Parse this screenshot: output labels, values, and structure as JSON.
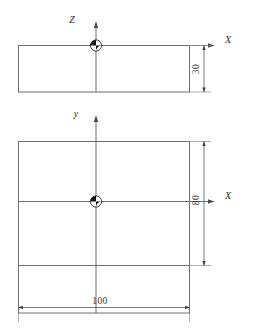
{
  "drawing": {
    "title": "Two-view orthographic dimension drawing with center of gravity marks",
    "background_color": "#ffffff",
    "line_color": "#6e6e6e",
    "text_color": "#2b2b2b",
    "marker_color": "#111111"
  },
  "views": {
    "front_view": {
      "name": "front-elevation",
      "axes": [
        {
          "id": "z-axis",
          "label": "Z",
          "direction": "up"
        },
        {
          "id": "x-axis-top",
          "label": "X",
          "direction": "right"
        }
      ],
      "origin_marker": "center-of-gravity-symbol",
      "dimensions": [
        {
          "id": "height-30",
          "value": "30",
          "orientation": "vertical",
          "side": "right"
        }
      ]
    },
    "top_view": {
      "name": "plan-view",
      "axes": [
        {
          "id": "y-axis",
          "label": "y",
          "direction": "up"
        },
        {
          "id": "x-axis-bottom",
          "label": "X",
          "direction": "right"
        }
      ],
      "origin_marker": "center-of-gravity-symbol",
      "dimensions": [
        {
          "id": "depth-80",
          "value": "80",
          "orientation": "vertical",
          "side": "right"
        },
        {
          "id": "width-100",
          "value": "100",
          "orientation": "horizontal",
          "side": "bottom"
        }
      ]
    }
  },
  "labels": {
    "axis_z": "Z",
    "axis_x_top": "X",
    "axis_y": "y",
    "axis_x_bottom": "X",
    "dim_30": "30",
    "dim_80": "80",
    "dim_100": "100"
  }
}
